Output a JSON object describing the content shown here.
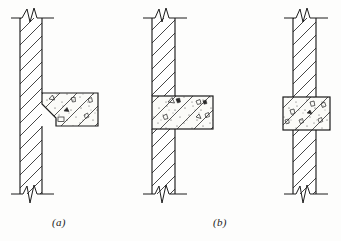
{
  "figure": {
    "background_color": "#fdfdfc",
    "line_color": "#1c1c1c",
    "hatch_color": "#2a2a2a",
    "concrete_fill": "#fbfbf8",
    "width": 341,
    "height": 241
  },
  "captions": {
    "a": "(a)",
    "b": "(b)"
  },
  "details": [
    {
      "id": "detail-a",
      "caption": "(a)",
      "wall": {
        "x": 20,
        "y": 18,
        "width": 22,
        "height": 176,
        "hatch": "diagonal-45",
        "label": "masonry-wall"
      },
      "beam": {
        "x": 42,
        "y": 93,
        "width": 56,
        "height": 33,
        "fill": "concrete-stipple",
        "label": "cantilever-beam",
        "engagement": "surface-bearing"
      },
      "break_lines": {
        "top_y": 18,
        "bottom_y": 194,
        "style": "zigzag"
      }
    },
    {
      "id": "detail-b-left",
      "caption": "(b)",
      "wall": {
        "x": 152,
        "y": 18,
        "width": 23,
        "height": 176,
        "hatch": "diagonal-45",
        "label": "masonry-wall"
      },
      "beam": {
        "x": 152,
        "y": 96,
        "width": 61,
        "height": 33,
        "fill": "concrete-stipple",
        "label": "partially-embedded-beam",
        "engagement": "partial-embedment"
      },
      "break_lines": {
        "top_y": 18,
        "bottom_y": 194,
        "style": "zigzag"
      }
    },
    {
      "id": "detail-b-right",
      "caption": "(b)",
      "wall": {
        "x": 293,
        "y": 18,
        "width": 23,
        "height": 176,
        "hatch": "diagonal-45",
        "label": "masonry-wall"
      },
      "beam": {
        "x": 283,
        "y": 97,
        "width": 47,
        "height": 33,
        "fill": "concrete-stipple",
        "label": "through-beam",
        "engagement": "full-penetration"
      },
      "break_lines": {
        "top_y": 18,
        "bottom_y": 194,
        "style": "zigzag"
      }
    }
  ],
  "legend": {
    "wall_hatch": "diagonal section hatching",
    "beam_fill": "concrete stipple with aggregate"
  }
}
